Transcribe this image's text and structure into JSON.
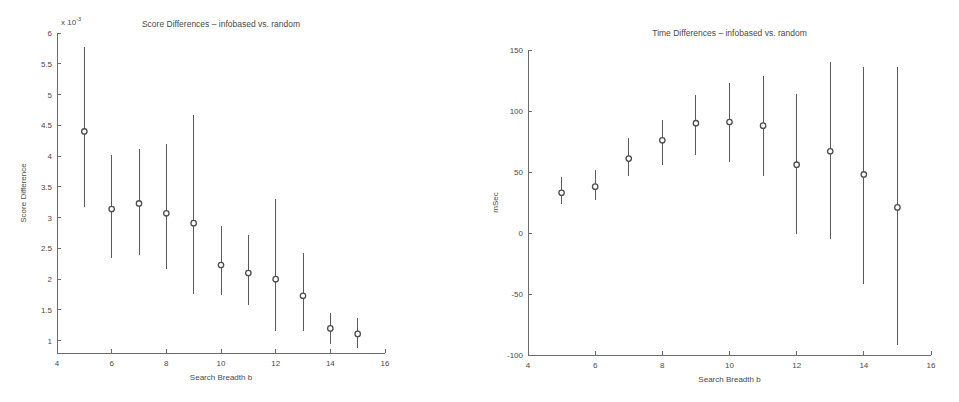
{
  "figure": {
    "background_color": "#ffffff",
    "ink_color": "#4a4a4a",
    "marker_color": "#4d4d4d",
    "shared_xlabel": "Search Breadth b"
  },
  "chart_data": [
    {
      "type": "scatter",
      "panel": "left",
      "title": "Score Differences – infobased vs. random",
      "xlabel": "Search Breadth b",
      "ylabel": "Score Difference",
      "y_exponent_label": "x 10",
      "y_exponent_power": "-3",
      "y_scale_factor": 0.001,
      "grid": false,
      "legend": "none",
      "xlim": [
        4,
        16
      ],
      "ylim": [
        0.8,
        6.0
      ],
      "xticks": [
        4,
        6,
        8,
        10,
        12,
        14,
        16
      ],
      "yticks": [
        1,
        1.5,
        2,
        2.5,
        3,
        3.5,
        4,
        4.5,
        5,
        5.5,
        6
      ],
      "ytick_labels": [
        "1",
        "1.5",
        "2",
        "2.5",
        "3",
        "3.5",
        "4",
        "4.5",
        "5",
        "5.5",
        "6"
      ],
      "xtick_labels": [
        "4",
        "6",
        "8",
        "10",
        "12",
        "14",
        "16"
      ],
      "x": [
        5,
        6,
        7,
        8,
        9,
        10,
        11,
        12,
        13,
        14,
        15
      ],
      "values": [
        4.4,
        3.14,
        3.23,
        3.07,
        2.91,
        2.23,
        2.1,
        2.0,
        1.73,
        1.2,
        1.11
      ],
      "err_low": [
        3.17,
        2.34,
        2.4,
        2.16,
        1.76,
        1.75,
        1.58,
        1.15,
        1.15,
        0.95,
        0.88
      ],
      "err_high": [
        5.77,
        4.01,
        4.11,
        4.19,
        4.66,
        2.86,
        2.72,
        3.3,
        2.42,
        1.45,
        1.37
      ]
    },
    {
      "type": "scatter",
      "panel": "right",
      "title": "Time Differences – infobased vs. random",
      "xlabel": "Search Breadth b",
      "ylabel": "mSec",
      "grid": false,
      "legend": "none",
      "xlim": [
        4,
        16
      ],
      "ylim": [
        -100,
        150
      ],
      "xticks": [
        4,
        6,
        8,
        10,
        12,
        14,
        16
      ],
      "yticks": [
        -100,
        -50,
        0,
        50,
        100,
        150
      ],
      "ytick_labels": [
        "-100",
        "-50",
        "0",
        "50",
        "100",
        "150"
      ],
      "xtick_labels": [
        "4",
        "6",
        "8",
        "10",
        "12",
        "14",
        "16"
      ],
      "x": [
        5,
        6,
        7,
        8,
        9,
        10,
        11,
        12,
        13,
        14,
        15
      ],
      "values": [
        33,
        38,
        61,
        76,
        90,
        91,
        88,
        56,
        67,
        48,
        21
      ],
      "err_low": [
        24,
        27,
        47,
        56,
        64,
        58,
        47,
        -1,
        -5,
        -42,
        -92
      ],
      "err_high": [
        46,
        52,
        78,
        93,
        113,
        123,
        129,
        114,
        140,
        136,
        136
      ]
    }
  ]
}
